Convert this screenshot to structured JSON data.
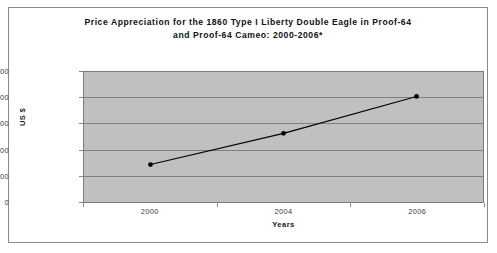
{
  "chart_data": {
    "type": "line",
    "title": "Price Appreciation for the 1860 Type I Liberty Double Eagle in Proof-64 and Proof-64 Cameo: 2000-2006*",
    "title_lines": [
      "Price Appreciation for the 1860 Type I Liberty Double Eagle in Proof-64",
      "and Proof-64 Cameo: 2000-2006*"
    ],
    "xlabel": "Years",
    "ylabel": "US $",
    "categories": [
      "2000",
      "2004",
      "2006"
    ],
    "values": [
      72000,
      132000,
      203000
    ],
    "series": [
      {
        "name": "Price Appreciation",
        "values": [
          72000,
          132000,
          203000
        ]
      }
    ],
    "ylim": [
      0,
      250000
    ],
    "ytick_values": [
      0,
      50000,
      100000,
      150000,
      200000,
      250000
    ],
    "ytick_labels": [
      "0",
      "50,000",
      "100,000",
      "150,000",
      "200,000",
      "250,000"
    ],
    "xtick_labels": [
      "2000",
      "2004",
      "2006"
    ],
    "grid": true,
    "grid_axis": "y",
    "legend": false,
    "legend_position": "none",
    "plot_background": "#c0c0c0",
    "figure_background": "#ffffff",
    "series_color": "#000000",
    "marker": "circle",
    "marker_color": "#000000",
    "gridline_color": "#808080",
    "border_color": "#8a8a8a",
    "annotations": [
      {
        "text": "*",
        "note": "asterisk following 2000-2006 in title"
      }
    ]
  }
}
